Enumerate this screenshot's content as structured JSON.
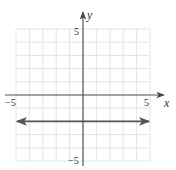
{
  "chart_data": {
    "type": "line",
    "title": "",
    "xlabel": "x",
    "ylabel": "y",
    "xlim": [
      -5,
      5
    ],
    "ylim": [
      -5,
      5
    ],
    "grid": true,
    "grid_step": 1,
    "x_ticks_labeled": [
      -5,
      5
    ],
    "y_ticks_labeled": [
      5,
      -5
    ],
    "tick_labels": {
      "x_neg": "−5",
      "x_pos": "5",
      "y_pos": "5",
      "y_neg": "−5"
    },
    "series": [
      {
        "name": "y = -2",
        "equation": "y = -2",
        "style": "horizontal line with arrows at both ends",
        "x": [
          -5,
          5
        ],
        "y": [
          -2,
          -2
        ]
      }
    ],
    "colors": {
      "line": "#555555",
      "axes": "#555555",
      "grid": "#e4e4e4"
    }
  }
}
